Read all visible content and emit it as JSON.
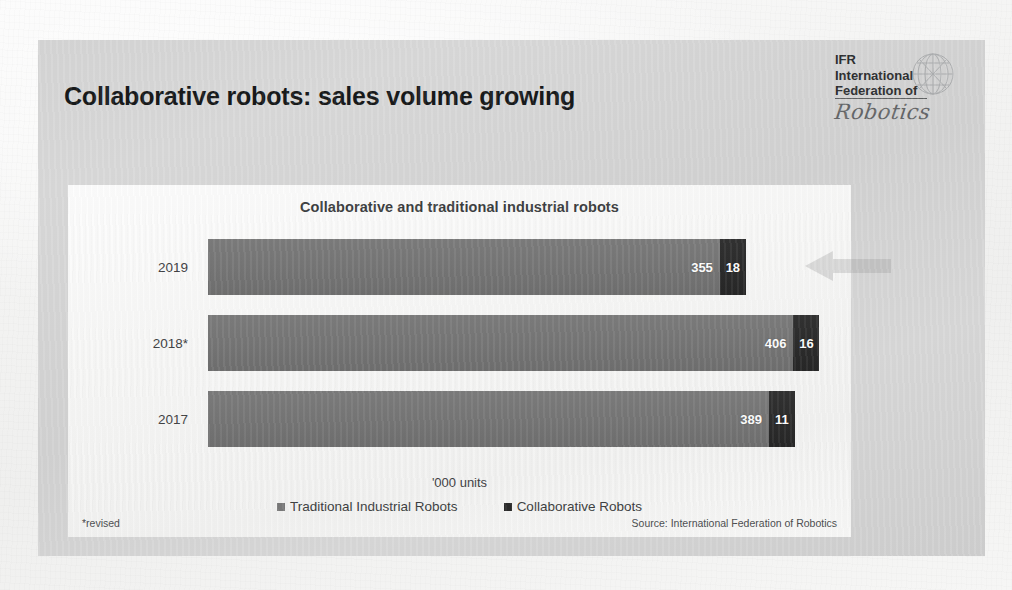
{
  "slide": {
    "title": "Collaborative robots: sales volume growing",
    "logo": {
      "line1": "IFR",
      "line2": "International",
      "line3": "Federation of",
      "script": "Robotics",
      "globe_icon": "globe-icon"
    },
    "footnote": "*revised",
    "source": "Source: International Federation of Robotics"
  },
  "chart_data": {
    "type": "bar",
    "orientation": "horizontal",
    "stacked": true,
    "title": "Collaborative and traditional industrial robots",
    "xlabel": "'000 units",
    "ylabel": "",
    "categories": [
      "2019",
      "2018*",
      "2017"
    ],
    "series": [
      {
        "name": "Traditional Industrial Robots",
        "color": "#767676",
        "values": [
          355,
          406,
          389
        ]
      },
      {
        "name": "Collaborative Robots",
        "color": "#2c2c2c",
        "values": [
          18,
          16,
          11
        ]
      }
    ],
    "totals": [
      373,
      422,
      400
    ],
    "legend_position": "bottom",
    "grid": false,
    "xlim": [
      0,
      430
    ],
    "units": "thousand units",
    "note": "2018 figures revised"
  }
}
